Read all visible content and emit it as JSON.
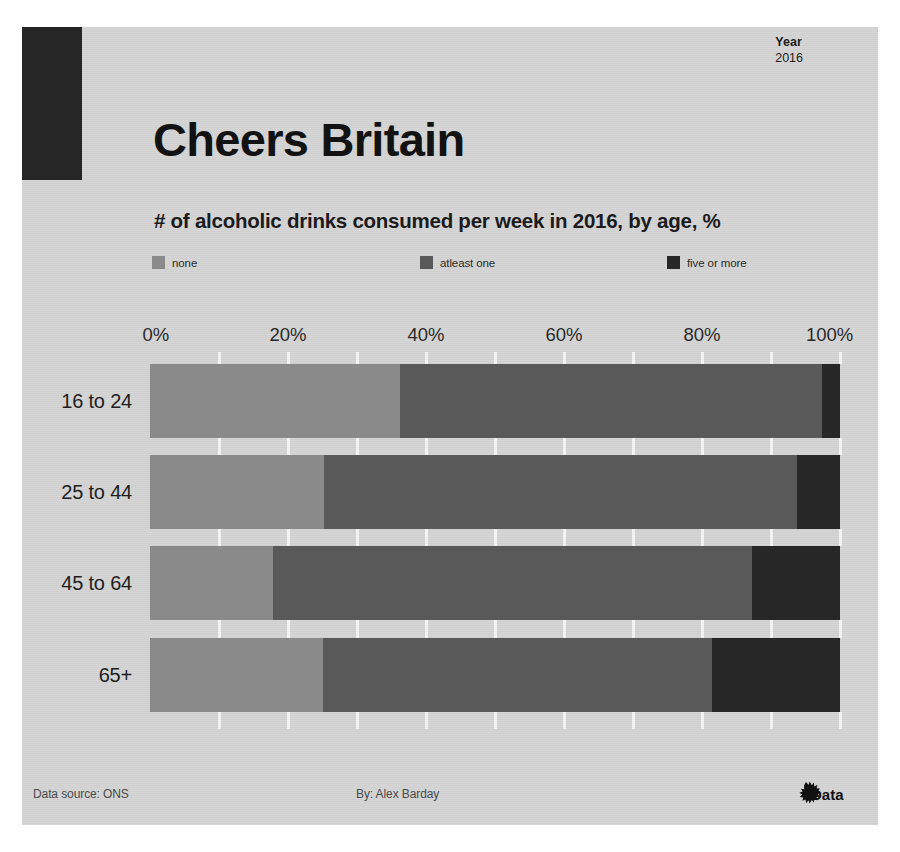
{
  "header": {
    "year_label": "Year",
    "year_value": "2016",
    "title": "Cheers Britain",
    "subtitle": "# of alcoholic drinks consumed per week in 2016, by age, %"
  },
  "legend": {
    "items": [
      {
        "label": "none",
        "color": "#8a8a8a",
        "left_px": 0
      },
      {
        "label": "atleast one",
        "color": "#595959",
        "left_px": 268
      },
      {
        "label": "five or more",
        "color": "#272727",
        "left_px": 515
      }
    ]
  },
  "footer": {
    "source": "Data source: ONS",
    "author": "By: Alex Barday",
    "logo_text": "Data"
  },
  "colors": {
    "background": "#d4d4d4",
    "page": "#ffffff",
    "header_block": "#262626",
    "none": "#8a8a8a",
    "atleast_one": "#595959",
    "five_or_more": "#272727",
    "text": "#1d1d1d",
    "gridline": "#f2f2f2"
  },
  "chart_data": {
    "type": "bar",
    "orientation": "horizontal",
    "stacked": true,
    "normalized": true,
    "title": "Cheers Britain",
    "subtitle": "# of alcoholic drinks consumed per week in 2016, by age, %",
    "xlabel": "",
    "ylabel": "",
    "xlim": [
      0,
      100
    ],
    "xticks": [
      0,
      20,
      40,
      60,
      80,
      100
    ],
    "xtick_labels": [
      "0%",
      "20%",
      "40%",
      "60%",
      "80%",
      "100%"
    ],
    "grid": true,
    "legend_position": "top",
    "categories": [
      "16 to 24",
      "25 to 44",
      "45 to 64",
      "65+"
    ],
    "series": [
      {
        "name": "none",
        "color": "#8a8a8a",
        "values": [
          36.2,
          25.2,
          17.8,
          25.1
        ]
      },
      {
        "name": "atleast one",
        "color": "#595959",
        "values": [
          61.2,
          68.6,
          69.4,
          56.3
        ]
      },
      {
        "name": "five or more",
        "color": "#272727",
        "values": [
          2.6,
          6.2,
          12.8,
          18.6
        ]
      }
    ]
  }
}
